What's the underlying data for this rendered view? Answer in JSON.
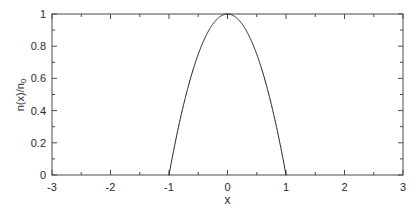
{
  "chart_data": {
    "type": "line",
    "title": "",
    "xlabel": "x",
    "ylabel": "n(x)/n0",
    "ylabel_base": "n(x)/n",
    "ylabel_sub": "0",
    "xlim": [
      -3,
      3
    ],
    "ylim": [
      0,
      1
    ],
    "grid": false,
    "legend": null,
    "xticks": [
      -3,
      -2,
      -1,
      0,
      1,
      2,
      3
    ],
    "xtick_labels": [
      "-3",
      "-2",
      "-1",
      "0",
      "1",
      "2",
      "3"
    ],
    "xminor_step": 0.5,
    "yticks": [
      0,
      0.2,
      0.4,
      0.6,
      0.8,
      1
    ],
    "ytick_labels": [
      "0",
      "0.2",
      "0.4",
      "0.6",
      "0.8",
      "1"
    ],
    "yminor_step": 0.1,
    "series": [
      {
        "name": "n(x)/n0",
        "formula": "max(0, 1 - x^2)",
        "color": "#1a1a1a",
        "linewidth": 1,
        "support": [
          -1,
          1
        ],
        "x": [
          -1.0,
          -0.95,
          -0.9,
          -0.85,
          -0.8,
          -0.75,
          -0.7,
          -0.65,
          -0.6,
          -0.55,
          -0.5,
          -0.45,
          -0.4,
          -0.35,
          -0.3,
          -0.25,
          -0.2,
          -0.15,
          -0.1,
          -0.05,
          0.0,
          0.05,
          0.1,
          0.15,
          0.2,
          0.25,
          0.3,
          0.35,
          0.4,
          0.45,
          0.5,
          0.55,
          0.6,
          0.65,
          0.7,
          0.75,
          0.8,
          0.85,
          0.9,
          0.95,
          1.0
        ],
        "y": [
          0.0,
          0.0975,
          0.19,
          0.2775,
          0.36,
          0.4375,
          0.51,
          0.5775,
          0.64,
          0.6975,
          0.75,
          0.7975,
          0.84,
          0.8775,
          0.91,
          0.9375,
          0.96,
          0.9775,
          0.99,
          0.9975,
          1.0,
          0.9975,
          0.99,
          0.9775,
          0.96,
          0.9375,
          0.91,
          0.8775,
          0.84,
          0.7975,
          0.75,
          0.6975,
          0.64,
          0.5775,
          0.51,
          0.4375,
          0.36,
          0.2775,
          0.19,
          0.0975,
          0.0
        ]
      }
    ],
    "peak": {
      "x": 0,
      "y": 1
    },
    "zeros": [
      -1,
      1
    ]
  },
  "style": {
    "background": "#ffffff",
    "axis_color": "#4a4a4a",
    "text_color": "#2b2b2b",
    "curve_color": "#1a1a1a"
  },
  "plot_box": {
    "left": 52,
    "top": 14,
    "right": 403,
    "bottom": 175
  }
}
